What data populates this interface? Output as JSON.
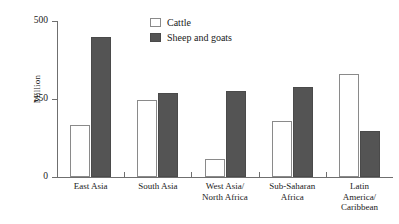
{
  "chart_data": {
    "type": "bar",
    "title": "",
    "subtitle": "",
    "xlabel": "",
    "ylabel": "Million",
    "ylim": [
      0,
      500
    ],
    "yticks": [
      0,
      250,
      500
    ],
    "ytick_labels": [
      "0",
      "250",
      "500"
    ],
    "grid": false,
    "legend_position": "top-center",
    "categories": [
      "East Asia",
      "South Asia",
      "West Asia/\nNorth Africa",
      "Sub-Saharan\nAfrica",
      "Latin\nAmerica/\nCaribbean"
    ],
    "series": [
      {
        "name": "Cattle",
        "color": "#ffffff",
        "values": [
          168,
          248,
          58,
          180,
          330
        ]
      },
      {
        "name": "Sheep and goats",
        "color": "#545454",
        "values": [
          450,
          270,
          275,
          288,
          147
        ]
      }
    ]
  },
  "legend": {
    "items": [
      {
        "label": "Cattle",
        "swatch": "cattle"
      },
      {
        "label": "Sheep and goats",
        "swatch": "sheep"
      }
    ]
  },
  "colors": {
    "cattle_fill": "#ffffff",
    "cattle_stroke": "#8a8a8a",
    "sheep_fill": "#545454",
    "sheep_stroke": "#4a4a4a",
    "axis": "#6f6f6f",
    "text": "#1a1a1a",
    "background": "#ffffff"
  }
}
